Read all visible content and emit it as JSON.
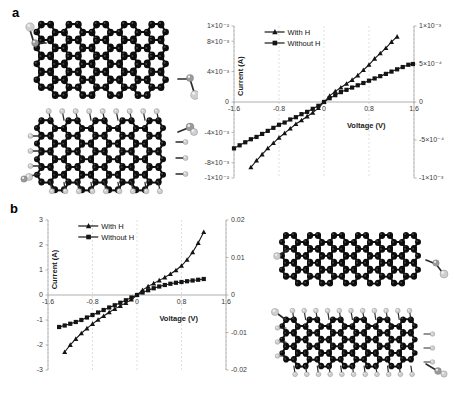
{
  "figure": {
    "panels": [
      {
        "label": "a"
      },
      {
        "label": "b"
      }
    ]
  },
  "panel_a": {
    "label": "a",
    "structures": [
      {
        "name": "pristine-graphene-nanoribbon-top-view",
        "caption": ""
      },
      {
        "name": "hydrogenated-graphene-nanoribbon-top-view",
        "caption": ""
      }
    ]
  },
  "panel_b": {
    "label": "b",
    "structures": [
      {
        "name": "pristine-graphene-nanoribbon-side-view",
        "caption": ""
      },
      {
        "name": "hydrogenated-graphene-nanoribbon-side-view",
        "caption": ""
      }
    ]
  },
  "chart_data": [
    {
      "type": "line",
      "panel": "a",
      "title": "",
      "xlabel": "Voltage (V)",
      "ylabel": "Current (A)",
      "xlim": [
        -1.6,
        1.6
      ],
      "ylim": [
        -0.01,
        0.01
      ],
      "y2lim": [
        -0.001,
        0.001
      ],
      "xticks": [
        "-1.6",
        "-0.8",
        "0",
        "0.8",
        "1.6"
      ],
      "xtick_values": [
        -1.6,
        -0.8,
        0,
        0.8,
        1.6
      ],
      "yticks": [
        "1×10⁻²",
        "8×10⁻³",
        "4×10⁻³",
        "0",
        "-4×10⁻³",
        "-8×10⁻³",
        "-1×10⁻²"
      ],
      "ytick_values": [
        0.01,
        0.008,
        0.004,
        0,
        -0.004,
        -0.008,
        -0.01
      ],
      "y2ticks": [
        "1×10⁻³",
        "5×10⁻⁴",
        "0",
        "-5×10⁻⁴",
        "-1×10⁻³"
      ],
      "y2tick_values": [
        0.001,
        0.0005,
        0,
        -0.0005,
        -0.001
      ],
      "grid": true,
      "legend_position": "top-left",
      "series": [
        {
          "name": "With H",
          "marker": "triangle",
          "axis": "left",
          "x": [
            -1.3,
            -1.2,
            -1.1,
            -1.0,
            -0.9,
            -0.8,
            -0.7,
            -0.6,
            -0.5,
            -0.4,
            -0.3,
            -0.2,
            -0.1,
            0,
            0.1,
            0.2,
            0.3,
            0.4,
            0.5,
            0.6,
            0.7,
            0.8,
            0.9,
            1.0,
            1.1,
            1.2,
            1.3
          ],
          "values": [
            -0.0086,
            -0.0077,
            -0.0069,
            -0.0061,
            -0.0054,
            -0.0047,
            -0.0041,
            -0.0035,
            -0.0029,
            -0.0024,
            -0.0019,
            -0.0014,
            -0.0008,
            0.0,
            0.0008,
            0.0014,
            0.0019,
            0.0024,
            0.0029,
            0.0035,
            0.0042,
            0.0049,
            0.0057,
            0.0064,
            0.0071,
            0.0079,
            0.0086
          ]
        },
        {
          "name": "Without H",
          "marker": "square",
          "axis": "right",
          "x": [
            -1.6,
            -1.5,
            -1.4,
            -1.3,
            -1.2,
            -1.1,
            -1.0,
            -0.9,
            -0.8,
            -0.7,
            -0.6,
            -0.5,
            -0.4,
            -0.3,
            -0.2,
            -0.1,
            0,
            0.1,
            0.2,
            0.3,
            0.4,
            0.5,
            0.6,
            0.7,
            0.8,
            0.9,
            1.0,
            1.1,
            1.2,
            1.3,
            1.4,
            1.5,
            1.58
          ],
          "values": [
            -0.00061,
            -0.00057,
            -0.00053,
            -0.00049,
            -0.00046,
            -0.00042,
            -0.00038,
            -0.00034,
            -0.0003,
            -0.00027,
            -0.00023,
            -0.0002,
            -0.00016,
            -0.00013,
            -9e-05,
            -5e-05,
            0.0,
            5e-05,
            9e-05,
            0.00013,
            0.00016,
            0.00019,
            0.00022,
            0.00025,
            0.00028,
            0.00031,
            0.00034,
            0.00037,
            0.0004,
            0.00043,
            0.00046,
            0.00049,
            0.0005
          ]
        }
      ]
    },
    {
      "type": "line",
      "panel": "b",
      "title": "",
      "xlabel": "Voltage (V)",
      "ylabel": "Current (A)",
      "xlim": [
        -1.6,
        1.6
      ],
      "ylim": [
        -3,
        3
      ],
      "y2lim": [
        -0.02,
        0.02
      ],
      "xticks": [
        "-1.6",
        "-0.8",
        "0",
        "0.8",
        "1.6"
      ],
      "xtick_values": [
        -1.6,
        -0.8,
        0,
        0.8,
        1.6
      ],
      "yticks": [
        "3",
        "2",
        "1",
        "0",
        "-1",
        "-2",
        "-3"
      ],
      "ytick_values": [
        3,
        2,
        1,
        0,
        -1,
        -2,
        -3
      ],
      "y2ticks": [
        "0.02",
        "0.01",
        "0",
        "-0.01",
        "-0.02"
      ],
      "y2tick_values": [
        0.02,
        0.01,
        0,
        -0.01,
        -0.02
      ],
      "grid": true,
      "legend_position": "top-left",
      "series": [
        {
          "name": "With H",
          "marker": "triangle",
          "axis": "right",
          "x": [
            -1.3,
            -1.2,
            -1.1,
            -1.0,
            -0.9,
            -0.8,
            -0.7,
            -0.6,
            -0.5,
            -0.4,
            -0.3,
            -0.2,
            -0.1,
            0,
            0.1,
            0.2,
            0.3,
            0.4,
            0.5,
            0.6,
            0.7,
            0.8,
            0.9,
            1.0,
            1.1,
            1.2
          ],
          "values": [
            -0.0152,
            -0.0133,
            -0.0117,
            -0.0102,
            -0.0089,
            -0.0077,
            -0.0066,
            -0.0056,
            -0.0046,
            -0.0037,
            -0.0029,
            -0.0021,
            -0.0012,
            0.0,
            0.0013,
            0.0023,
            0.0031,
            0.0039,
            0.0047,
            0.0056,
            0.0066,
            0.0078,
            0.0094,
            0.0114,
            0.0139,
            0.0168
          ]
        },
        {
          "name": "Without H",
          "marker": "square",
          "axis": "left",
          "x": [
            -1.4,
            -1.3,
            -1.2,
            -1.1,
            -1.0,
            -0.9,
            -0.8,
            -0.7,
            -0.6,
            -0.5,
            -0.4,
            -0.3,
            -0.2,
            -0.1,
            0,
            0.1,
            0.2,
            0.3,
            0.4,
            0.5,
            0.6,
            0.7,
            0.8,
            0.9,
            1.0,
            1.1,
            1.2
          ],
          "values": [
            -1.28,
            -1.22,
            -1.15,
            -1.08,
            -1.0,
            -0.9,
            -0.8,
            -0.7,
            -0.6,
            -0.5,
            -0.41,
            -0.31,
            -0.21,
            -0.1,
            0.0,
            0.1,
            0.19,
            0.27,
            0.34,
            0.4,
            0.45,
            0.49,
            0.52,
            0.55,
            0.58,
            0.61,
            0.64
          ]
        }
      ]
    }
  ]
}
